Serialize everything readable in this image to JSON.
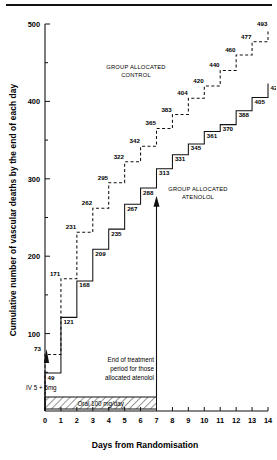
{
  "figure": {
    "ylabel": "Cumulative number of vascular deaths by the end of each day",
    "xlabel": "Days from Randomisation",
    "group_control": "GROUP ALLOCATED\nCONTROL",
    "group_control_line1": "GROUP ALLOCATED",
    "group_control_line2": "CONTROL",
    "group_atenolol_line1": "GROUP ALLOCATED",
    "group_atenolol_line2": "ATENOLOL",
    "annotation_line1": "End of treatment",
    "annotation_line2": "period for those",
    "annotation_line3": "allocated atenolol",
    "iv_label": "IV 5 + 5mg",
    "oral_label": "Oral 100 mg/day"
  },
  "chart_data": {
    "type": "line",
    "title": "",
    "xlabel": "Days from Randomisation",
    "ylabel": "Cumulative number of vascular deaths by the end of each day",
    "xlim": [
      0,
      14
    ],
    "ylim": [
      0,
      500
    ],
    "xticks": [
      0,
      1,
      2,
      3,
      4,
      5,
      6,
      7,
      8,
      9,
      10,
      11,
      12,
      13,
      14
    ],
    "xticklabels": [
      "0",
      "1",
      "2",
      "3",
      "4",
      "5",
      "6",
      "7",
      "8",
      "9",
      "10",
      "11",
      "12",
      "13",
      "14"
    ],
    "yticks": [
      100,
      200,
      300,
      400,
      500
    ],
    "yticklabels": [
      "100",
      "200",
      "300",
      "400",
      "500"
    ],
    "yminorticks": [
      50,
      150,
      250,
      350,
      450
    ],
    "grid": false,
    "legend": "inline-annotations",
    "series": [
      {
        "name": "GROUP ALLOCATED CONTROL",
        "style": "dashed",
        "x": [
          0,
          1,
          2,
          3,
          4,
          5,
          6,
          7,
          8,
          9,
          10,
          11,
          12,
          13,
          14
        ],
        "values": [
          73,
          171,
          231,
          262,
          295,
          322,
          342,
          365,
          383,
          404,
          420,
          440,
          460,
          477,
          493
        ]
      },
      {
        "name": "GROUP ALLOCATED ATENOLOL",
        "style": "solid",
        "x": [
          0,
          1,
          2,
          3,
          4,
          5,
          6,
          7,
          8,
          9,
          10,
          11,
          12,
          13,
          14
        ],
        "values": [
          49,
          121,
          168,
          209,
          235,
          267,
          288,
          313,
          331,
          345,
          361,
          370,
          388,
          405,
          423
        ]
      }
    ],
    "annotations": [
      {
        "text": "End of treatment period for those allocated atenolol",
        "x": 7
      },
      {
        "text": "IV 5 + 5mg",
        "x": 0
      },
      {
        "text": "Oral 100 mg/day",
        "x": 3.5
      }
    ]
  }
}
